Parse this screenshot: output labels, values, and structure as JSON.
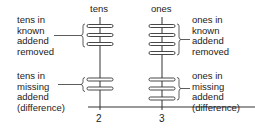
{
  "diagram": {
    "columns": [
      {
        "header": "tens",
        "digit": "2",
        "known_label": "tens in\nknown\naddend\nremoved",
        "missing_label": "tens in\nmissing\naddend\n(difference)",
        "known_count": 3,
        "missing_count": 2
      },
      {
        "header": "ones",
        "digit": "3",
        "known_label": "ones in\nknown\naddend\nremoved",
        "missing_label": "ones in\nmissing\naddend\n(difference)",
        "known_count": 4,
        "missing_count": 3
      }
    ],
    "colors": {
      "line": "#333333",
      "disk_fill": "#ffffff"
    }
  }
}
